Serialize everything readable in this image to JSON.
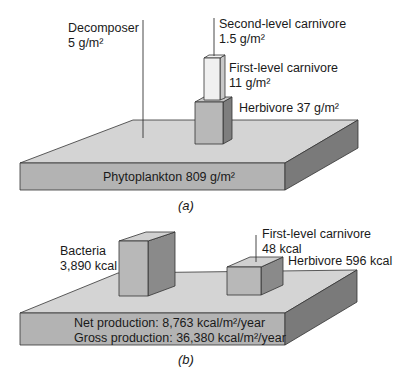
{
  "panel_a": {
    "caption": "(a)",
    "unit": "g/m²",
    "decomposer": {
      "name": "Decomposer",
      "value": "5 g/m²"
    },
    "second_level_carnivore": {
      "name": "Second-level carnivore",
      "value": "1.5 g/m²"
    },
    "first_level_carnivore": {
      "name": "First-level carnivore",
      "value": "11 g/m²"
    },
    "herbivore": {
      "label": "Herbivore 37 g/m²"
    },
    "phytoplankton": {
      "label": "Phytoplankton 809 g/m²"
    }
  },
  "panel_b": {
    "caption": "(b)",
    "bacteria": {
      "name": "Bacteria",
      "value": "3,890 kcal"
    },
    "first_level_carnivore": {
      "name": "First-level carnivore",
      "value": "48 kcal"
    },
    "herbivore": {
      "label": "Herbivore 596 kcal"
    },
    "net_production": "Net production:  8,763 kcal/m²/year",
    "gross_production": "Gross production:  36,380 kcal/m²/year"
  },
  "colors": {
    "slab_top": "#d4d4d4",
    "slab_front": "#b3b3b3",
    "slab_side": "#7a7a7a",
    "box_front": "#b8b8b8",
    "box_side": "#8a8a8a",
    "box_top": "#d0d0d0",
    "light_box": "#f0f0f0",
    "line": "#333333"
  }
}
